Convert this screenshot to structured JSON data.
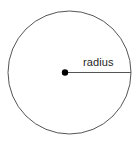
{
  "figure": {
    "type": "geometry-diagram",
    "background_color": "#ffffff",
    "width": 140,
    "height": 144,
    "circle": {
      "name": "circle-outline",
      "center_x": 69.5,
      "center_y": 72.5,
      "radius": 61.5,
      "stroke_color": "#555555",
      "stroke_width": 1,
      "fill": "none"
    },
    "center_point": {
      "name": "center-point",
      "x": 65,
      "y": 72.5,
      "diameter": 6.4,
      "fill_color": "#000000"
    },
    "radius_segment": {
      "name": "radius-line",
      "x1": 65,
      "y1": 72.5,
      "x2": 131,
      "y2": 72.5,
      "stroke_color": "#555555",
      "stroke_width": 1
    },
    "label": {
      "name": "radius-label",
      "text": "radius",
      "x": 83,
      "y": 56,
      "font_size": 11,
      "color": "#262626"
    }
  }
}
